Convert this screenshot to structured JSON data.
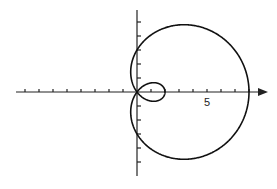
{
  "chart_data": {
    "type": "line",
    "title": "",
    "xlabel": "",
    "ylabel": "",
    "equation": "r = 3 + 5 cos(theta)",
    "curve": "limacon with inner loop",
    "x_tick_labels": [
      {
        "value": 5,
        "label": "5"
      }
    ],
    "xlim": [
      -9,
      9
    ],
    "ylim": [
      -6,
      6
    ],
    "x_ticks": [
      -8,
      -7,
      -6,
      -5,
      -4,
      -3,
      -2,
      -1,
      1,
      2,
      3,
      4,
      5,
      6,
      7,
      8
    ],
    "y_ticks": [
      -5,
      -4,
      -3,
      -2,
      -1,
      1,
      2,
      3,
      4,
      5
    ],
    "key_points": {
      "outer_x_intercept": 8,
      "inner_loop_x_intercept": 2,
      "y_intercepts": [
        3,
        -3
      ],
      "pole": [
        0,
        0
      ]
    },
    "grid": false,
    "legend": null,
    "colors": {
      "curve": "#111111",
      "axes": "#222222",
      "background": "#ffffff"
    }
  }
}
